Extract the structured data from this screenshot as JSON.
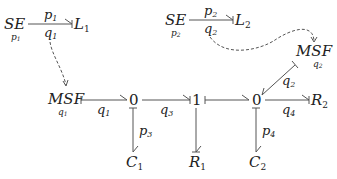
{
  "diagram": {
    "type": "bond-graph",
    "nodes": {
      "se1": {
        "label": "SE",
        "sub": "p1",
        "sub_text": "p",
        "sub_idx": "1"
      },
      "l1": {
        "label": "L",
        "idx": "1"
      },
      "se2": {
        "label": "SE",
        "sub_text": "p",
        "sub_idx": "2"
      },
      "l2": {
        "label": "L",
        "idx": "2"
      },
      "msf1": {
        "label": "MSF",
        "sub_text": "q",
        "sub_idx": "1"
      },
      "msf2": {
        "label": "MSF",
        "sub_text": "q",
        "sub_idx": "2"
      },
      "j0a": {
        "label": "0"
      },
      "j1": {
        "label": "1"
      },
      "j0b": {
        "label": "0"
      },
      "r2": {
        "label": "R",
        "idx": "2"
      },
      "c1": {
        "label": "C",
        "idx": "1"
      },
      "r1": {
        "label": "R",
        "idx": "1"
      },
      "c2": {
        "label": "C",
        "idx": "2"
      }
    },
    "bonds": {
      "se1_l1": {
        "top": "p",
        "top_idx": "1",
        "bottom": "q",
        "bottom_idx": "1"
      },
      "se2_l2": {
        "top": "p",
        "top_idx": "2",
        "bottom": "q",
        "bottom_idx": "2"
      },
      "msf1_j0a": {
        "label": "q",
        "idx": "1"
      },
      "j0a_j1": {
        "label": "q",
        "idx": "3"
      },
      "j0a_c1": {
        "label": "p",
        "idx": "3"
      },
      "j0b_c2": {
        "label": "p",
        "idx": "4"
      },
      "j0b_r2": {
        "label": "q",
        "idx": "4"
      },
      "msf2_j0b": {
        "label": "q",
        "idx": "2"
      }
    },
    "signals": [
      {
        "from": "se1_l1 (q1)",
        "to": "msf1"
      },
      {
        "from": "se2_l2 (q2)",
        "to": "msf2"
      }
    ]
  }
}
